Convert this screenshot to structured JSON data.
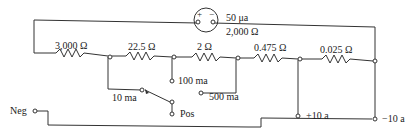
{
  "diagram": {
    "meter": {
      "current": "50 μa",
      "resistance": "2,000 Ω",
      "plus": "+",
      "minus": "−"
    },
    "resistors": [
      {
        "value": "3,000 Ω"
      },
      {
        "value": "22.5 Ω"
      },
      {
        "value": "2 Ω"
      },
      {
        "value": "0.475 Ω"
      },
      {
        "value": "0.025 Ω"
      }
    ],
    "taps": {
      "ma10": "10 ma",
      "ma100": "100 ma",
      "ma500": "500 ma",
      "a10_pos": "+10 a",
      "a10_neg": "−10 a",
      "pos": "Pos",
      "neg": "Neg"
    }
  }
}
